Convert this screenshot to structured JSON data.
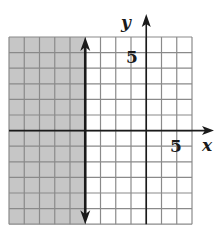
{
  "graph": {
    "inequality": "x ≤ -4",
    "x_range": [
      -9,
      3
    ],
    "y_range": [
      -6,
      6
    ],
    "boundary_x": -4,
    "boundary_style": "solid",
    "shaded_side": "left",
    "axis_labels": {
      "x": "x",
      "y": "y"
    },
    "tick_labels": {
      "x": "5",
      "y": "5"
    },
    "colors": {
      "shade": "#c6c6c6",
      "grid": "#8a8a8a",
      "axis": "#1a1a1a",
      "background": "#ffffff"
    }
  },
  "layout": {
    "grid_left": 9,
    "grid_top": 37,
    "cell_w": 15.25,
    "cell_h": 15.6
  }
}
